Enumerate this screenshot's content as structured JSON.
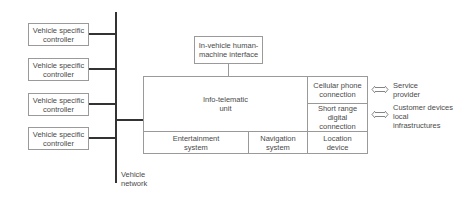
{
  "diagram": {
    "controllers": [
      {
        "label": "Vehicle specific controller"
      },
      {
        "label": "Vehicle specific controller"
      },
      {
        "label": "Vehicle specific controller"
      },
      {
        "label": "Vehicle specific controller"
      }
    ],
    "bus_label": "Vehicle network",
    "hmi": {
      "label": "In-vehicle human-machine interface"
    },
    "unit": {
      "main_label": "Info-telematic unit",
      "bottom_cells": [
        {
          "label": "Entertainment system"
        },
        {
          "label": "Navigation system"
        },
        {
          "label": "Location device"
        }
      ],
      "right_cells": [
        {
          "label": "Cellular phone connection"
        },
        {
          "label": "Short range digital connection"
        }
      ]
    },
    "external": [
      {
        "label": "Service provider",
        "connects_to": "Cellular phone connection"
      },
      {
        "label": "Customer devices local infrastructures",
        "connects_to": "Short range digital connection"
      }
    ],
    "colors": {
      "bus": "#333333",
      "border": "#9a9a9a",
      "text": "#4a4a4a"
    }
  }
}
